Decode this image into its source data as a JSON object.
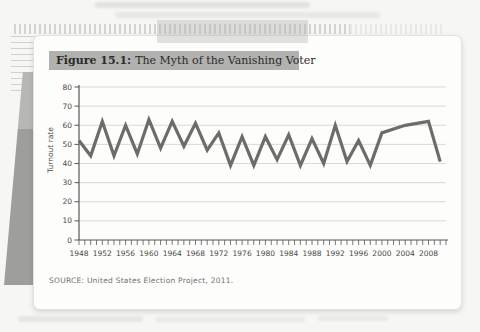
{
  "figure": {
    "label": "Figure 15.1:",
    "title": "The Myth of the Vanishing Voter",
    "source": "SOURCE: United States Election Project, 2011."
  },
  "colors": {
    "line": "#6c6c6a",
    "grid": "#d9d9d7",
    "axis": "#575755",
    "tick_label": "#4a4a48",
    "titlebar_bg": "#b1b1af",
    "card_bg": "#fdfdfb",
    "page_bg": "#f6f6f4"
  },
  "chart_data": {
    "type": "line",
    "xlabel": "",
    "ylabel": "Turnout rate",
    "ylim": [
      0,
      80
    ],
    "xlim": [
      1948,
      2011
    ],
    "yticks": [
      0,
      10,
      20,
      30,
      40,
      50,
      60,
      70,
      80
    ],
    "xtick_labels": [
      1948,
      1952,
      1956,
      1960,
      1964,
      1968,
      1972,
      1976,
      1980,
      1984,
      1988,
      1992,
      1996,
      2000,
      2004,
      2008
    ],
    "minor_xticks_every_year": true,
    "grid": true,
    "legend": "none",
    "series": [
      {
        "name": "Turnout rate",
        "x": [
          1948,
          1950,
          1952,
          1954,
          1956,
          1958,
          1960,
          1962,
          1964,
          1966,
          1968,
          1970,
          1972,
          1974,
          1976,
          1978,
          1980,
          1982,
          1984,
          1986,
          1988,
          1990,
          1992,
          1994,
          1996,
          1998,
          2000,
          2002,
          2004,
          2006,
          2008,
          2010
        ],
        "y": [
          52,
          44,
          62,
          44,
          60,
          45,
          63,
          48,
          62,
          49,
          61,
          47,
          56,
          39,
          54,
          39,
          54,
          42,
          55,
          39,
          53,
          40,
          60,
          41,
          52,
          39,
          56,
          58,
          60,
          61,
          62,
          41
        ]
      }
    ]
  }
}
